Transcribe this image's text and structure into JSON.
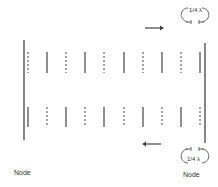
{
  "diagram": {
    "labels": {
      "node_left": "Node",
      "node_right": "Node",
      "quarter_top": "1/4 λ",
      "quarter_bottom": "1/4 λ"
    },
    "arrows": {
      "top_direction": "right",
      "bottom_direction": "left"
    },
    "rows": {
      "top": [
        "dashed",
        "solid",
        "dashed",
        "solid",
        "dashed",
        "solid",
        "dashed",
        "solid",
        "dashed",
        "solid"
      ],
      "bottom": [
        "solid",
        "dashed",
        "solid",
        "dashed",
        "solid",
        "dashed",
        "solid",
        "dashed",
        "solid",
        "dashed"
      ]
    },
    "colors": {
      "stroke": "#444444",
      "background": "#ffffff"
    }
  }
}
